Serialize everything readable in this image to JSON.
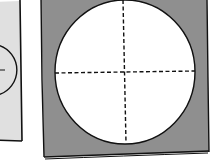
{
  "diagram": {
    "left_panel": {
      "fill": "#e0e0e0",
      "stroke": "#111111",
      "circle_fill": "#e0e0e0"
    },
    "right_panel": {
      "fill": "#8f8f8f",
      "stroke": "#111111",
      "circle_fill": "#ffffff",
      "crosshair_style": "dashed"
    },
    "background": "#ffffff"
  }
}
